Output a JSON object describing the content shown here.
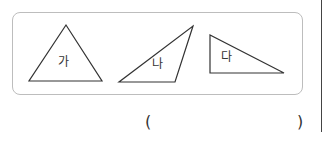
{
  "figure": {
    "triangles": [
      {
        "label": "가",
        "points": "66,25 29,81 102,81"
      },
      {
        "label": "나",
        "points": "119,82 175,82 193,26"
      },
      {
        "label": "다",
        "points": "210,35 210,73 284,73"
      }
    ],
    "stroke_color": "#333333",
    "box_border_color": "#bdbdbd"
  },
  "answer": {
    "open_paren": "(",
    "close_paren": ")"
  }
}
